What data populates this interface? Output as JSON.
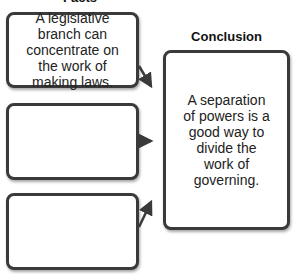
{
  "facts_heading": "Facts",
  "conclusion_heading": "Conclusion",
  "facts": [
    {
      "text": "A legislative branch can concentrate on the work of making laws."
    },
    {
      "text": ""
    },
    {
      "text": ""
    }
  ],
  "conclusion": {
    "text": "A separation of powers is a good way to divide the work of governing."
  }
}
